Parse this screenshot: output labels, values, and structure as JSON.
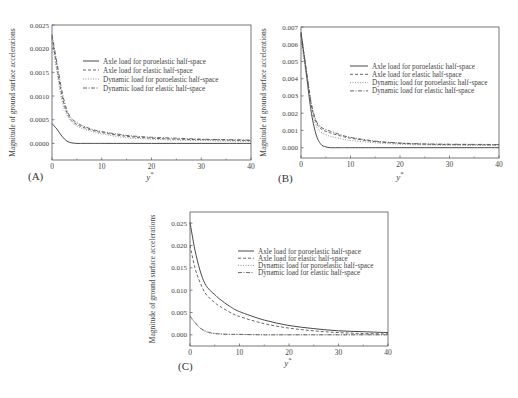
{
  "chart_data": [
    {
      "type": "line",
      "panel": "(A)",
      "title": "",
      "xlabel": "y*",
      "ylabel": "Magnitude of ground surface accelerations",
      "xlim": [
        0,
        40
      ],
      "ylim": [
        -0.00035,
        0.0025
      ],
      "xticks": [
        0,
        10,
        20,
        30,
        40
      ],
      "yticks": [
        "0.0000",
        "0.0005",
        "0.0010",
        "0.0015",
        "0.0020",
        "0.0025"
      ],
      "ytick_values": [
        0,
        0.0005,
        0.001,
        0.0015,
        0.002,
        0.0025
      ],
      "legend_position": "upper right (inside)",
      "x": [
        0,
        1,
        2,
        3,
        4,
        5,
        6,
        8,
        10,
        15,
        20,
        25,
        30,
        35,
        40
      ],
      "series": [
        {
          "name": "Axle load for poroelastic half-space",
          "style": "solid",
          "values": [
            0.00042,
            0.0003,
            0.00015,
            5e-05,
            1e-05,
            0.0,
            0.0,
            0.0,
            0.0,
            0.0,
            0.0,
            0.0,
            0.0,
            0.0,
            0.0
          ]
        },
        {
          "name": "Axle load for elastic half-space",
          "style": "dashed",
          "values": [
            0.00225,
            0.0016,
            0.001,
            0.00065,
            0.00048,
            0.0004,
            0.00035,
            0.00028,
            0.00023,
            0.00015,
            0.00011,
            9e-05,
            8e-05,
            7e-05,
            6e-05
          ]
        },
        {
          "name": "Dynamic load for poroelastic half-space",
          "style": "dotted",
          "values": [
            0.0022,
            0.0015,
            0.0009,
            0.0006,
            0.00044,
            0.00037,
            0.00032,
            0.00025,
            0.0002,
            0.00012,
            9e-05,
            7e-05,
            6e-05,
            5e-05,
            4e-05
          ]
        },
        {
          "name": "Dynamic load for elastic half-space",
          "style": "dashdot",
          "values": [
            0.0023,
            0.0017,
            0.0011,
            0.0007,
            0.00052,
            0.00044,
            0.00038,
            0.0003,
            0.00025,
            0.00017,
            0.00013,
            0.00011,
            9e-05,
            8e-05,
            7e-05
          ]
        }
      ]
    },
    {
      "type": "line",
      "panel": "(B)",
      "title": "",
      "xlabel": "y*",
      "ylabel": "Magnitude of ground surface accelerations",
      "xlim": [
        0,
        40
      ],
      "ylim": [
        -0.0006,
        0.007
      ],
      "xticks": [
        0,
        10,
        20,
        30,
        40
      ],
      "yticks": [
        "0.000",
        "0.001",
        "0.002",
        "0.003",
        "0.004",
        "0.005",
        "0.006",
        "0.007"
      ],
      "ytick_values": [
        0,
        0.001,
        0.002,
        0.003,
        0.004,
        0.005,
        0.006,
        0.007
      ],
      "legend_position": "upper right (inside)",
      "x": [
        0,
        1,
        2,
        3,
        4,
        5,
        6,
        8,
        10,
        15,
        20,
        25,
        30,
        35,
        40
      ],
      "series": [
        {
          "name": "Axle load for poroelastic half-space",
          "style": "solid",
          "values": [
            0.0067,
            0.0045,
            0.0022,
            0.0008,
            0.0002,
            5e-05,
            0.0,
            0.0,
            0.0,
            0.0,
            0.0,
            0.0,
            0.0,
            0.0,
            0.0
          ]
        },
        {
          "name": "Axle load for elastic half-space",
          "style": "dashed",
          "values": [
            0.0065,
            0.0046,
            0.0026,
            0.0015,
            0.0011,
            0.00095,
            0.00085,
            0.00068,
            0.00055,
            0.00035,
            0.00025,
            0.0002,
            0.00018,
            0.00017,
            0.00016
          ]
        },
        {
          "name": "Dynamic load for poroelastic half-space",
          "style": "dotted",
          "values": [
            0.0062,
            0.0043,
            0.0023,
            0.0013,
            0.0009,
            0.00075,
            0.00065,
            0.00052,
            0.00042,
            0.00028,
            0.0002,
            0.00016,
            0.00014,
            0.00013,
            0.00012
          ]
        },
        {
          "name": "Dynamic load for elastic half-space",
          "style": "dashdot",
          "values": [
            0.0066,
            0.0047,
            0.0027,
            0.0016,
            0.0012,
            0.00105,
            0.00095,
            0.00075,
            0.0006,
            0.00038,
            0.00027,
            0.00022,
            0.0002,
            0.00019,
            0.00018
          ]
        }
      ]
    },
    {
      "type": "line",
      "panel": "(C)",
      "title": "",
      "xlabel": "y*",
      "ylabel": "Magnitude of ground surface accelerations",
      "xlim": [
        0,
        40
      ],
      "ylim": [
        -0.0025,
        0.0275
      ],
      "xticks": [
        0,
        10,
        20,
        30,
        40
      ],
      "yticks": [
        "0.000",
        "0.005",
        "0.010",
        "0.015",
        "0.020",
        "0.025"
      ],
      "ytick_values": [
        0,
        0.005,
        0.01,
        0.015,
        0.02,
        0.025
      ],
      "legend_position": "upper right (inside)",
      "x": [
        0,
        1,
        2,
        3,
        4,
        5,
        6,
        8,
        10,
        15,
        20,
        25,
        30,
        35,
        40
      ],
      "series": [
        {
          "name": "Axle load for poroelastic half-space",
          "style": "solid",
          "values": [
            0.0252,
            0.019,
            0.0145,
            0.0115,
            0.01,
            0.009,
            0.008,
            0.0064,
            0.0052,
            0.0033,
            0.0021,
            0.0014,
            0.0009,
            0.0007,
            0.0005
          ]
        },
        {
          "name": "Axle load for elastic half-space",
          "style": "dashed",
          "values": [
            0.02,
            0.015,
            0.0118,
            0.0095,
            0.0082,
            0.0072,
            0.0064,
            0.0051,
            0.0041,
            0.0025,
            0.0015,
            0.0009,
            0.0005,
            0.0003,
            0.0002
          ]
        },
        {
          "name": "Dynamic load for poroelastic half-space",
          "style": "dotted",
          "values": [
            0.004,
            0.0027,
            0.0015,
            0.0008,
            0.0004,
            0.0003,
            0.0002,
            0.0001,
            0.0001,
            0.0,
            0.0,
            0.0,
            0.0,
            0.0,
            0.0
          ]
        },
        {
          "name": "Dynamic load for elastic half-space",
          "style": "dashdot",
          "values": [
            0.0042,
            0.0028,
            0.0016,
            0.0009,
            0.0005,
            0.0003,
            0.0002,
            0.0001,
            0.0001,
            0.0,
            0.0,
            0.0,
            0.0,
            0.0,
            0.0
          ]
        }
      ]
    }
  ],
  "layout": {
    "panels": [
      {
        "box": [
          52,
          25,
          251,
          160
        ],
        "legend": {
          "x": 83,
          "y": 61,
          "dy": 9,
          "len": 16
        },
        "label_pos": [
          28,
          178
        ],
        "xlabel_pos": [
          150,
          180
        ],
        "ylabel_x": 15
      },
      {
        "box": [
          301,
          27,
          499,
          158
        ],
        "legend": {
          "x": 350,
          "y": 66,
          "dy": 8.3,
          "len": 18
        },
        "label_pos": [
          280,
          178
        ],
        "xlabel_pos": [
          400,
          180
        ],
        "ylabel_x": 266
      },
      {
        "box": [
          190,
          212,
          388,
          346
        ],
        "legend": {
          "x": 238,
          "y": 251,
          "dy": 7.2,
          "len": 16
        },
        "label_pos": [
          181,
          368
        ],
        "xlabel_pos": [
          288,
          366
        ],
        "ylabel_x": 155
      }
    ]
  }
}
